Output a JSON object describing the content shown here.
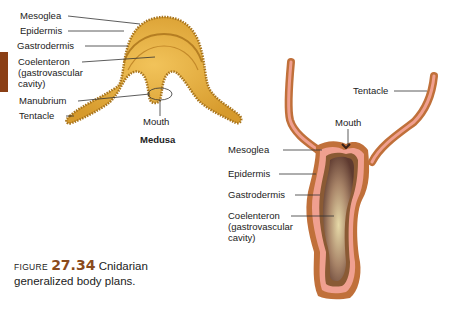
{
  "medusa": {
    "title": "Medusa",
    "labels": {
      "mesoglea": "Mesoglea",
      "epidermis": "Epidermis",
      "gastrodermis": "Gastrodermis",
      "coelenteron_1": "Coelenteron",
      "coelenteron_2": "(gastrovascular",
      "coelenteron_3": "cavity)",
      "manubrium": "Manubrium",
      "tentacle": "Tentacle",
      "mouth": "Mouth"
    }
  },
  "polyp": {
    "labels": {
      "tentacle": "Tentacle",
      "mouth": "Mouth",
      "mesoglea": "Mesoglea",
      "epidermis": "Epidermis",
      "gastrodermis": "Gastrodermis",
      "coelenteron_1": "Coelenteron",
      "coelenteron_2": "(gastrovascular",
      "coelenteron_3": "cavity)"
    }
  },
  "caption": {
    "figure_word": "Figure",
    "figure_number": "27.34",
    "line1_text": "Cnidarian",
    "line2_text": "generalized body plans."
  },
  "colors": {
    "medusa_body": "#e0a93a",
    "medusa_edge": "#a8741c",
    "polyp_outer": "#c0703a",
    "polyp_pink": "#f0a090",
    "polyp_cavity": "#6b4a3c",
    "figure_number": "#8a4a1c",
    "tab": "#8a3f16"
  }
}
